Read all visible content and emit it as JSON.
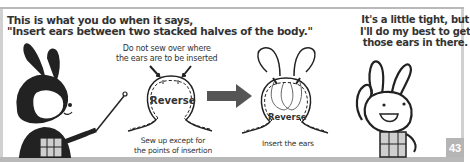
{
  "header": {
    "line1": "This is what you do when it says,",
    "line2": "\"Insert ears between two stacked halves of the body.\""
  },
  "diagram": {
    "note_line1": "Do not sew over where",
    "note_line2": "the ears are to be inserted",
    "step1_label": "Reverse",
    "step1_caption_line1": "Sew up except for",
    "step1_caption_line2": "the points of insertion",
    "step2_label": "Reverse",
    "step2_caption": "Insert the ears"
  },
  "speech": {
    "line1": "It's a little tight, but",
    "line2": "I'll do my best to get",
    "line3": "those ears in there."
  },
  "page_number": "43",
  "colors": {
    "border": "#b9b9b9",
    "ink": "#222222",
    "page_badge": "#b5b5b5"
  }
}
